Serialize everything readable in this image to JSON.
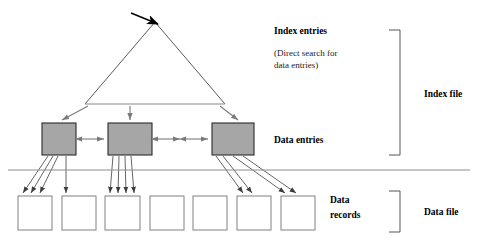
{
  "diagram": {
    "canvas": {
      "width": 477,
      "height": 246,
      "background": "#ffffff"
    },
    "colors": {
      "entry_box_fill": "#a6a6a6",
      "entry_box_stroke": "#2b2b2b",
      "record_box_fill": "#ffffff",
      "record_box_stroke": "#808080",
      "line": "#4a4a4a",
      "triangle": "#5a5a5a",
      "separator": "#8d8d8d",
      "text": "#000000"
    },
    "labels": {
      "index_entries": "Index entries",
      "direct_search_line1": "(Direct search for",
      "direct_search_line2": "data entries)",
      "data_entries": "Data entries",
      "data_records_line1": "Data",
      "data_records_line2": "records",
      "index_file": "Index file",
      "data_file": "Data file"
    },
    "triangle": {
      "apex_x": 155,
      "apex_y": 22,
      "left_x": 85,
      "right_x": 225,
      "base_y": 104
    },
    "search_arrow": {
      "from_x": 131,
      "from_y": 13,
      "to_x": 158,
      "to_y": 24
    },
    "entry_boxes": [
      {
        "id": "data-entry-block-1",
        "x": 42,
        "y": 123,
        "w": 34,
        "h": 32
      },
      {
        "id": "data-entry-block-2",
        "x": 108,
        "y": 123,
        "w": 44,
        "h": 32
      },
      {
        "id": "data-entry-block-3",
        "x": 212,
        "y": 123,
        "w": 42,
        "h": 32
      }
    ],
    "record_boxes": [
      {
        "id": "data-record-1",
        "x": 18,
        "y": 196,
        "w": 34,
        "h": 34
      },
      {
        "id": "data-record-2",
        "x": 62,
        "y": 196,
        "w": 34,
        "h": 34
      },
      {
        "id": "data-record-3",
        "x": 105,
        "y": 196,
        "w": 35,
        "h": 34
      },
      {
        "id": "data-record-4",
        "x": 150,
        "y": 196,
        "w": 34,
        "h": 34
      },
      {
        "id": "data-record-5",
        "x": 193,
        "y": 196,
        "w": 34,
        "h": 34
      },
      {
        "id": "data-record-6",
        "x": 237,
        "y": 196,
        "w": 34,
        "h": 34
      },
      {
        "id": "data-record-7",
        "x": 281,
        "y": 196,
        "w": 34,
        "h": 34
      }
    ],
    "separator_line": {
      "x1": 8,
      "y1": 170,
      "x2": 470,
      "y2": 170
    },
    "brackets": {
      "index_file": {
        "x": 400,
        "y_top": 30,
        "y_bottom": 155,
        "arm": 11
      },
      "data_file": {
        "x": 400,
        "y_top": 191,
        "y_bottom": 232,
        "arm": 11
      }
    },
    "text_positions": {
      "index_entries": {
        "x": 274,
        "y": 34
      },
      "direct_search_line1": {
        "x": 274,
        "y": 56
      },
      "direct_search_line2": {
        "x": 274,
        "y": 68
      },
      "data_entries": {
        "x": 274,
        "y": 143
      },
      "data_records_line1": {
        "x": 330,
        "y": 203
      },
      "data_records_line2": {
        "x": 330,
        "y": 218
      },
      "index_file": {
        "x": 424,
        "y": 97
      },
      "data_file": {
        "x": 424,
        "y": 215
      }
    },
    "descent_arrows": [
      {
        "id": "index-to-entry-1",
        "x1": 88,
        "y1": 106,
        "x2": 62,
        "y2": 120
      },
      {
        "id": "index-to-entry-2",
        "x1": 130,
        "y1": 106,
        "x2": 130,
        "y2": 120
      },
      {
        "id": "index-to-entry-3",
        "x1": 220,
        "y1": 106,
        "x2": 238,
        "y2": 120
      }
    ],
    "sibling_arrows": [
      {
        "id": "sibling-link-1",
        "x1": 80,
        "y1": 139,
        "x2": 104,
        "y2": 139
      },
      {
        "id": "sibling-link-2",
        "x1": 156,
        "y1": 139,
        "x2": 180,
        "y2": 139
      },
      {
        "id": "sibling-link-3",
        "x1": 184,
        "y1": 139,
        "x2": 208,
        "y2": 139
      }
    ],
    "fan_arrows": [
      {
        "id": "entry1-to-record1-a",
        "x1": 48,
        "y1": 156,
        "x2": 23,
        "y2": 193
      },
      {
        "id": "entry1-to-record1-b",
        "x1": 53,
        "y1": 156,
        "x2": 31,
        "y2": 193
      },
      {
        "id": "entry1-to-record1-c",
        "x1": 58,
        "y1": 156,
        "x2": 40,
        "y2": 193
      },
      {
        "id": "entry1-to-record2-a",
        "x1": 66,
        "y1": 156,
        "x2": 66,
        "y2": 193
      },
      {
        "id": "entry2-to-record3-a",
        "x1": 113,
        "y1": 156,
        "x2": 110,
        "y2": 193
      },
      {
        "id": "entry2-to-record3-b",
        "x1": 119,
        "y1": 156,
        "x2": 118,
        "y2": 193
      },
      {
        "id": "entry2-to-record3-c",
        "x1": 125,
        "y1": 156,
        "x2": 126,
        "y2": 193
      },
      {
        "id": "entry2-to-record3-d",
        "x1": 131,
        "y1": 156,
        "x2": 134,
        "y2": 193
      },
      {
        "id": "entry3-to-record6-a",
        "x1": 216,
        "y1": 156,
        "x2": 243,
        "y2": 193
      },
      {
        "id": "entry3-to-record6-b",
        "x1": 223,
        "y1": 156,
        "x2": 252,
        "y2": 193
      },
      {
        "id": "entry3-to-record7-a",
        "x1": 233,
        "y1": 156,
        "x2": 285,
        "y2": 193
      },
      {
        "id": "entry3-to-record7-b",
        "x1": 243,
        "y1": 156,
        "x2": 296,
        "y2": 193
      }
    ]
  }
}
